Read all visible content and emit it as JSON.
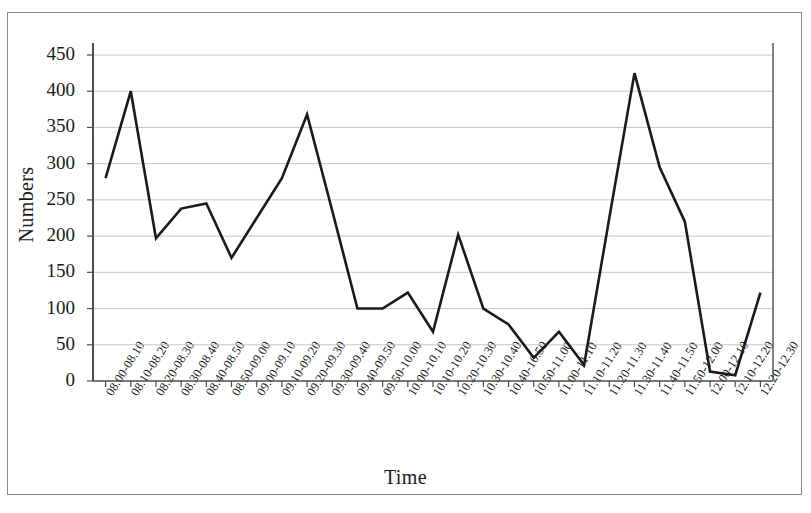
{
  "chart_data": {
    "type": "line",
    "title": "",
    "xlabel": "Time",
    "ylabel": "Numbers",
    "ylim": [
      0,
      450
    ],
    "ytick_step": 50,
    "yticks": [
      0,
      50,
      100,
      150,
      200,
      250,
      300,
      350,
      400,
      450
    ],
    "grid": true,
    "legend": false,
    "legend_position": "none",
    "line_color": "#1a1a1a",
    "gridline_color": "#bfbfbf",
    "axis_color": "#4d4d4d",
    "categories": [
      "08.00-08.10",
      "08.10-08.20",
      "08.20-08.30",
      "08.30-08.40",
      "08.40-08.50",
      "08.50-09.00",
      "09.00-09.10",
      "09.10-09.20",
      "09.20-09.30",
      "09.30-09.40",
      "09.40-09.50",
      "09.50-10.00",
      "10.00-10.10",
      "10.10-10.20",
      "10.20-10.30",
      "10.30-10.40",
      "10.40-10.50",
      "10.50-11.00",
      "11.00-11.10",
      "11.10-11.20",
      "11.20-11.30",
      "11.30-11.40",
      "11.40-11.50",
      "11.50-12.00",
      "12.00-12.10",
      "12.10-12.20",
      "12.20-12.30"
    ],
    "values": [
      280,
      400,
      197,
      238,
      245,
      170,
      225,
      280,
      368,
      235,
      100,
      100,
      122,
      68,
      202,
      100,
      78,
      32,
      68,
      22,
      225,
      425,
      295,
      220,
      13,
      8,
      122
    ],
    "series": [
      {
        "name": "Numbers",
        "values": [
          280,
          400,
          197,
          238,
          245,
          170,
          225,
          280,
          368,
          235,
          100,
          100,
          122,
          68,
          202,
          100,
          78,
          32,
          68,
          22,
          225,
          425,
          295,
          220,
          13,
          8,
          122
        ]
      }
    ]
  }
}
